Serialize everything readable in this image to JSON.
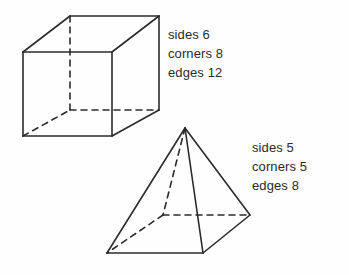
{
  "page": {
    "background_color": "#fefefe",
    "ink_color": "#2b2b2b",
    "width": 349,
    "height": 275
  },
  "figures": [
    {
      "id": "cube",
      "shape_name": "cube",
      "labels": {
        "sides": "sides 6",
        "corners": "corners 8",
        "edges": "edges 12"
      },
      "counts": {
        "sides": 6,
        "corners": 8,
        "edges": 12
      }
    },
    {
      "id": "pyramid",
      "shape_name": "square-pyramid",
      "labels": {
        "sides": "sides 5",
        "corners": "corners 5",
        "edges": "edges 8"
      },
      "counts": {
        "sides": 5,
        "corners": 5,
        "edges": 8
      }
    }
  ],
  "geometry": {
    "cube": {
      "front_top_left": [
        23,
        52
      ],
      "front_top_right": [
        112,
        52
      ],
      "front_bottom_left": [
        23,
        136
      ],
      "front_bottom_right": [
        112,
        136
      ],
      "back_top_left": [
        70,
        16
      ],
      "back_top_right": [
        159,
        16
      ],
      "back_bottom_left": [
        70,
        110
      ],
      "back_bottom_right": [
        159,
        110
      ],
      "hidden_vertex": "back_bottom_left"
    },
    "pyramid": {
      "apex": [
        185,
        128
      ],
      "base_front_left": [
        107,
        253
      ],
      "base_front_right": [
        203,
        253
      ],
      "base_right": [
        250,
        215
      ],
      "base_back": [
        163,
        215
      ],
      "hidden_vertex": "base_back"
    }
  }
}
